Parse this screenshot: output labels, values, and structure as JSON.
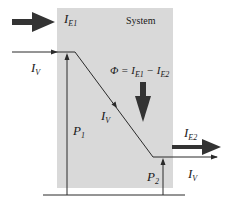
{
  "diagram": {
    "system_label": "System",
    "energy_in": {
      "symbol": "I",
      "subscript": "E1"
    },
    "energy_out": {
      "symbol": "I",
      "subscript": "E2"
    },
    "flow_in": {
      "symbol": "I",
      "subscript": "V"
    },
    "flow_mid": {
      "symbol": "I",
      "subscript": "V"
    },
    "flow_out": {
      "symbol": "I",
      "subscript": "V"
    },
    "potential_1": {
      "symbol": "P",
      "subscript": "1"
    },
    "potential_2": {
      "symbol": "P",
      "subscript": "2"
    },
    "power_equation": {
      "lhs": "Φ = ",
      "t1": "I",
      "t1_sub": "E1",
      "minus": " − ",
      "t2": "I",
      "t2_sub": "E2"
    },
    "colors": {
      "system_fill": "#d9d9d9",
      "line": "#2a2a2a",
      "arrow": "#333333"
    }
  }
}
